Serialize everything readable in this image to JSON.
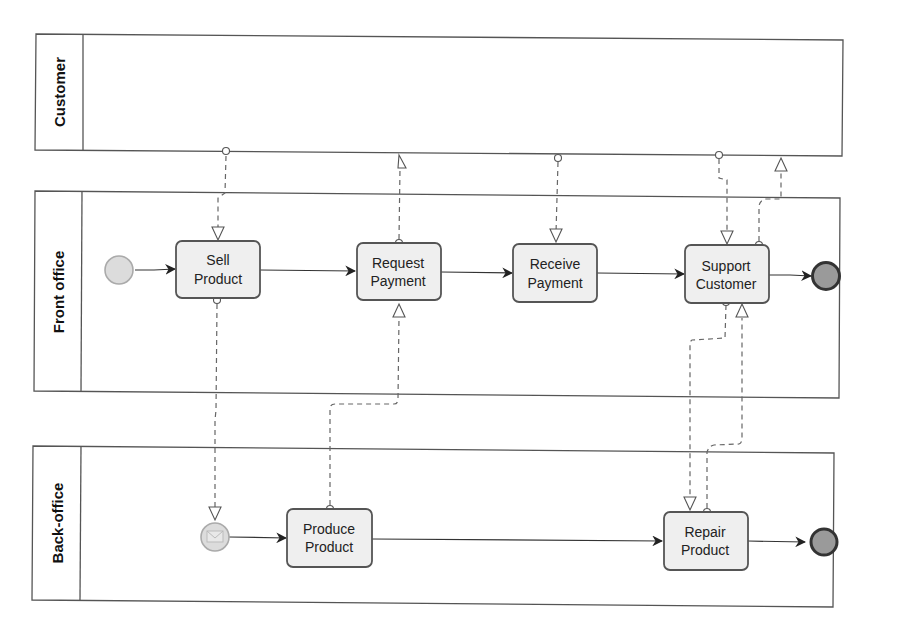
{
  "diagram": {
    "type": "BPMN collaboration / swimlane process",
    "lanes": [
      {
        "id": "customer",
        "label": "Customer"
      },
      {
        "id": "front",
        "label": "Front office"
      },
      {
        "id": "back",
        "label": "Back-office"
      }
    ],
    "tasks": {
      "sell": {
        "line1": "Sell",
        "line2": "Product"
      },
      "request": {
        "line1": "Request",
        "line2": "Payment"
      },
      "receive": {
        "line1": "Receive",
        "line2": "Payment"
      },
      "support": {
        "line1": "Support",
        "line2": "Customer"
      },
      "produce": {
        "line1": "Produce",
        "line2": "Product"
      },
      "repair": {
        "line1": "Repair",
        "line2": "Product"
      }
    },
    "events": {
      "front_start": "Start event",
      "front_end": "End event",
      "back_start": "Message start event",
      "back_end": "End event"
    },
    "sequence_flows": [
      [
        "front_start",
        "sell"
      ],
      [
        "sell",
        "request"
      ],
      [
        "request",
        "receive"
      ],
      [
        "receive",
        "support"
      ],
      [
        "support",
        "front_end"
      ],
      [
        "back_start",
        "produce"
      ],
      [
        "produce",
        "repair"
      ],
      [
        "repair",
        "back_end"
      ]
    ],
    "message_flows": [
      [
        "customer",
        "sell"
      ],
      [
        "request",
        "customer"
      ],
      [
        "customer",
        "receive"
      ],
      [
        "customer",
        "support"
      ],
      [
        "support",
        "customer"
      ],
      [
        "sell",
        "back_start"
      ],
      [
        "produce",
        "request"
      ],
      [
        "support",
        "repair"
      ],
      [
        "repair",
        "support"
      ]
    ],
    "colors": {
      "task_fill": "#efefef",
      "task_stroke": "#555555",
      "start_fill": "#dcdcdc",
      "end_fill": "#9a9a9a",
      "end_stroke": "#333333"
    }
  }
}
